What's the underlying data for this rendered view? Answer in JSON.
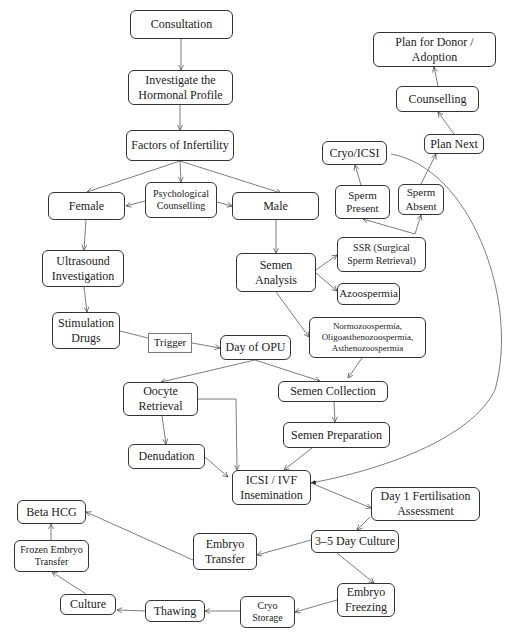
{
  "diagram": {
    "nodes": {
      "consultation": "Consultation",
      "hormonal_profile": "Investigate the Hormonal Profile",
      "factors": "Factors of Infertility",
      "female": "Female",
      "psych_counselling": "Psychological Counselling",
      "male": "Male",
      "ultrasound": "Ultrasound Investigation",
      "semen_analysis": "Semen Analysis",
      "ssr": "SSR (Surgical Sperm Retrieval)",
      "azoospermia": "Azoospermia",
      "sperm_present": "Sperm Present",
      "sperm_absent": "Sperm Absent",
      "cryo_icsi": "Cryo/ICSI",
      "plan_next": "Plan Next",
      "counselling": "Counselling",
      "plan_donor": "Plan for Donor / Adoption",
      "stimulation": "Stimulation Drugs",
      "trigger": "Trigger",
      "day_opu": "Day of OPU",
      "normozoospermia": "Normozoospermia, Oligoasthenozoospermia, Asthenozoospermia",
      "oocyte_retrieval": "Oocyte Retrieval",
      "semen_collection": "Semen Collection",
      "semen_preparation": "Semen Preparation",
      "denudation": "Denudation",
      "icsi_ivf": "ICSI / IVF Insemination",
      "day1": "Day 1 Fertilisation Assessment",
      "culture_3_5": "3–5 Day Culture",
      "embryo_transfer": "Embryo Transfer",
      "beta_hcg": "Beta HCG",
      "frozen_transfer": "Frozen Embryo Transfer",
      "embryo_freezing": "Embryo Freezing",
      "cryo_storage": "Cryo Storage",
      "thawing": "Thawing",
      "culture": "Culture"
    },
    "edges": [
      [
        "consultation",
        "hormonal_profile"
      ],
      [
        "hormonal_profile",
        "factors"
      ],
      [
        "factors",
        "female"
      ],
      [
        "factors",
        "psych_counselling"
      ],
      [
        "factors",
        "male"
      ],
      [
        "psych_counselling",
        "female"
      ],
      [
        "psych_counselling",
        "male"
      ],
      [
        "female",
        "ultrasound"
      ],
      [
        "ultrasound",
        "stimulation"
      ],
      [
        "stimulation",
        "trigger"
      ],
      [
        "trigger",
        "day_opu"
      ],
      [
        "male",
        "semen_analysis"
      ],
      [
        "semen_analysis",
        "ssr"
      ],
      [
        "semen_analysis",
        "azoospermia"
      ],
      [
        "semen_analysis",
        "normozoospermia"
      ],
      [
        "ssr",
        "sperm_present"
      ],
      [
        "ssr",
        "sperm_absent"
      ],
      [
        "sperm_present",
        "cryo_icsi"
      ],
      [
        "sperm_absent",
        "plan_next"
      ],
      [
        "plan_next",
        "counselling"
      ],
      [
        "counselling",
        "plan_donor"
      ],
      [
        "cryo_icsi",
        "icsi_ivf"
      ],
      [
        "day_opu",
        "oocyte_retrieval"
      ],
      [
        "day_opu",
        "semen_collection"
      ],
      [
        "normozoospermia",
        "semen_collection"
      ],
      [
        "semen_collection",
        "semen_preparation"
      ],
      [
        "semen_preparation",
        "icsi_ivf"
      ],
      [
        "oocyte_retrieval",
        "denudation"
      ],
      [
        "oocyte_retrieval",
        "icsi_ivf"
      ],
      [
        "denudation",
        "icsi_ivf"
      ],
      [
        "icsi_ivf",
        "day1"
      ],
      [
        "day1",
        "culture_3_5"
      ],
      [
        "culture_3_5",
        "embryo_transfer"
      ],
      [
        "culture_3_5",
        "embryo_freezing"
      ],
      [
        "embryo_transfer",
        "beta_hcg"
      ],
      [
        "embryo_freezing",
        "cryo_storage"
      ],
      [
        "cryo_storage",
        "thawing"
      ],
      [
        "thawing",
        "culture"
      ],
      [
        "culture",
        "frozen_transfer"
      ],
      [
        "frozen_transfer",
        "beta_hcg"
      ]
    ]
  }
}
